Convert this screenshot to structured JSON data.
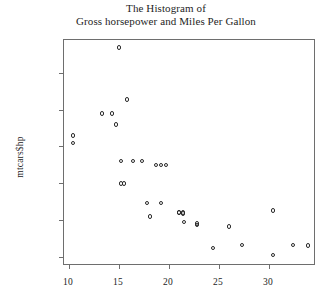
{
  "chart_data": {
    "type": "scatter",
    "title": "The Histogram of",
    "subtitle": "Gross horsepower and Miles Per Gallon",
    "xlabel": "",
    "ylabel": "mtcars$hp",
    "xlim": [
      9.5,
      34.5
    ],
    "ylim": [
      40,
      345
    ],
    "grid": false,
    "legend": "none",
    "marker": "open-circle",
    "xticks": [
      10,
      15,
      20,
      25,
      30
    ],
    "yticks": [
      50,
      100,
      150,
      200,
      250,
      300
    ],
    "xtick_labels": [
      "10",
      "15",
      "20",
      "25",
      "30"
    ],
    "ytick_labels": [
      "50",
      "100",
      "150",
      "200",
      "250",
      "300"
    ],
    "x": [
      21.0,
      21.0,
      22.8,
      21.4,
      18.7,
      18.1,
      14.3,
      24.4,
      22.8,
      19.2,
      17.8,
      16.4,
      17.3,
      15.2,
      10.4,
      10.4,
      14.7,
      32.4,
      30.4,
      33.9,
      21.5,
      15.5,
      15.2,
      13.3,
      19.2,
      27.3,
      26.0,
      30.4,
      15.8,
      19.7,
      15.0,
      21.4
    ],
    "y": [
      110,
      110,
      93,
      110,
      175,
      105,
      245,
      62,
      95,
      123,
      123,
      180,
      180,
      180,
      205,
      215,
      230,
      66,
      52,
      65,
      97,
      150,
      150,
      245,
      175,
      66,
      91,
      113,
      264,
      175,
      335,
      109
    ]
  },
  "figure": {
    "title_line1": "The Histogram of",
    "title_line2": "Gross horsepower and Miles Per Gallon"
  }
}
